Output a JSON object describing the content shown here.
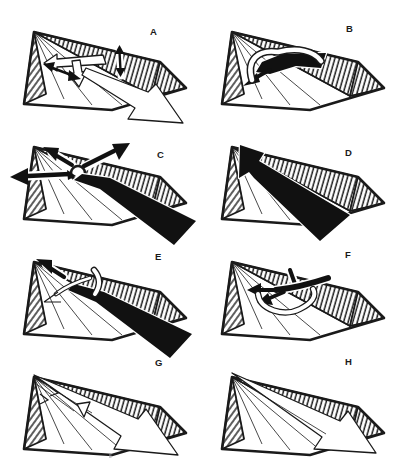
{
  "colors": {
    "ink": "#1a1a1a",
    "fill_black": "#111111",
    "paper": "#ffffff"
  },
  "panels": [
    {
      "id": "a",
      "label": "A",
      "motifs": [
        "white-transverse-arrows",
        "white-axial-outflow-arrow",
        "black-extension-double-arrows"
      ]
    },
    {
      "id": "b",
      "label": "B",
      "motifs": [
        "white-ribbon-loop",
        "black-fan-lobe-arrow"
      ]
    },
    {
      "id": "c",
      "label": "C",
      "motifs": [
        "black-radial-overflow-arrows",
        "black-eddy-circle",
        "black-axial-outflow-band"
      ]
    },
    {
      "id": "d",
      "label": "D",
      "motifs": [
        "black-axial-inflow-band-arrow"
      ]
    },
    {
      "id": "e",
      "label": "E",
      "motifs": [
        "black-apexward-arrow",
        "white-curved-arrow",
        "white-ridge-crossing-channel",
        "black-axial-outflow-band"
      ]
    },
    {
      "id": "f",
      "label": "F",
      "motifs": [
        "black-branching-fan-arrows",
        "white-ribbon-loop"
      ]
    },
    {
      "id": "g",
      "label": "G",
      "motifs": [
        "white-branching-axial-arrows",
        "white-outflow-chevron-arrow"
      ]
    },
    {
      "id": "h",
      "label": "H",
      "motifs": [
        "white-axial-outflow-arrow"
      ]
    }
  ]
}
